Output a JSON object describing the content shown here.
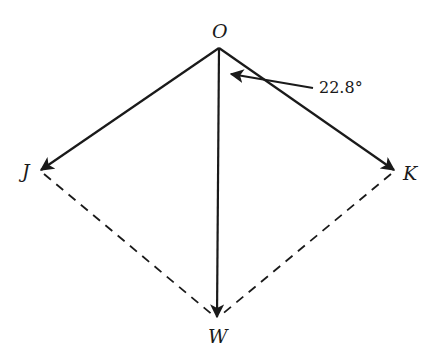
{
  "diagram": {
    "type": "vector-force-diagram",
    "points": {
      "O": {
        "label": "O",
        "x": 219,
        "y": 48
      },
      "J": {
        "label": "J",
        "x": 40,
        "y": 170
      },
      "K": {
        "label": "K",
        "x": 395,
        "y": 170
      },
      "W": {
        "label": "W",
        "x": 217,
        "y": 318
      }
    },
    "vectors": [
      {
        "from": "O",
        "to": "J",
        "style": "solid",
        "arrow": true
      },
      {
        "from": "O",
        "to": "K",
        "style": "solid",
        "arrow": true
      },
      {
        "from": "O",
        "to": "W",
        "style": "solid",
        "arrow": true
      }
    ],
    "dashed_lines": [
      {
        "from": "J",
        "to": "W"
      },
      {
        "from": "K",
        "to": "W"
      }
    ],
    "angle_annotation": {
      "text": "22.8°",
      "between": [
        "OW",
        "OK"
      ]
    },
    "colors": {
      "line": "#1a1a1a",
      "background": "#ffffff"
    }
  }
}
